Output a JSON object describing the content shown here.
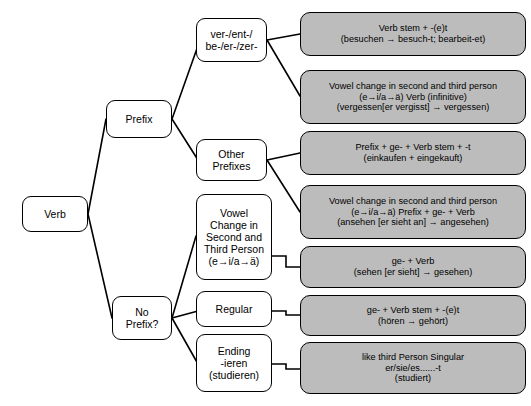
{
  "diagram": {
    "colors": {
      "detail_fill": "#bcbcbc",
      "plain_fill": "#ffffff",
      "stroke": "#000000"
    },
    "nodes": {
      "verb": "Verb",
      "prefix": "Prefix",
      "no_prefix": "No\nPrefix?",
      "inseparable_prefixes": "ver-/ent-/\nbe-/er-/zer-",
      "other_prefixes": "Other\nPrefixes",
      "vowel_change": "Vowel\nChange in\nSecond and\nThird Person\n(e→i/a→ä)",
      "regular": "Regular",
      "ending_ieren": "Ending\n-ieren\n(studieren)"
    },
    "rules": {
      "rule_stem_et": "Verb stem + -(e)t\n(besuchen → besuch-t; bearbeit-et)",
      "rule_vowel_infinitive": "Vowel change in second and third person\n(e→i/a→ä) Verb (infinitive)\n(vergessen[er vergisst] → vergessen)",
      "rule_prefix_ge_stem_t": "Prefix + ge- + Verb stem + -t\n(einkaufen + eingekauft)",
      "rule_vowel_prefix_ge": "Vowel change in second and third person\n(e→i/a→ä) Prefix + ge- + Verb\n(ansehen [er sieht an] → angesehen)",
      "rule_ge_verb": "ge- + Verb\n(sehen [er sieht] → gesehen)",
      "rule_ge_stem_et": "ge- + Verb stem + -(e)t\n(hören → gehört)",
      "rule_ieren": "like third Person Singular\ner/sie/es......-t\n(studiert)"
    }
  }
}
